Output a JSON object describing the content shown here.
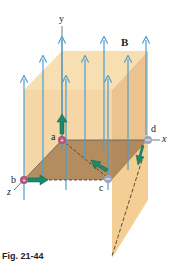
{
  "figure": {
    "caption": "Fig. 21-44",
    "field_label": "B",
    "axes": {
      "x": "x",
      "y": "y",
      "z": "z"
    },
    "points": [
      {
        "label": "a",
        "charge": "+"
      },
      {
        "label": "b",
        "charge": "+"
      },
      {
        "label": "c",
        "charge": "−"
      },
      {
        "label": "d",
        "charge": "−"
      }
    ],
    "colors": {
      "field_lines": "#4a9fd4",
      "box_face": "#f2c98a",
      "shaded_plane": "#a27a4e",
      "velocity_arrows": "#1a8a6a",
      "positive_charge": "#b3527a",
      "negative_charge": "#9aa4c0"
    }
  }
}
